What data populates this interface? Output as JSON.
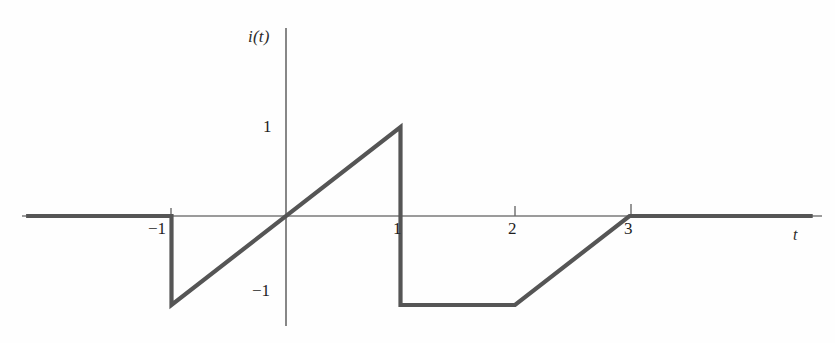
{
  "figure": {
    "kind": "waveform-plot",
    "background": "#fefefe",
    "axis_color": "#6b6b6b",
    "curve_color": "#555555",
    "text_color": "#1f1f1f"
  },
  "axes": {
    "y_axis_label": "i(t)",
    "x_axis_label": "t",
    "x_ticks": [
      {
        "value": -1,
        "label": "−1"
      },
      {
        "value": 1,
        "label": "1"
      },
      {
        "value": 2,
        "label": "2"
      },
      {
        "value": 3,
        "label": "3"
      }
    ],
    "y_ticks": [
      {
        "value": 1,
        "label": "1"
      },
      {
        "value": -1,
        "label": "−1"
      }
    ]
  },
  "chart_data": {
    "type": "line",
    "title": "",
    "xlabel": "t",
    "ylabel": "i(t)",
    "xlim": [
      -2.5,
      4.6
    ],
    "ylim": [
      -1.65,
      1.65
    ],
    "grid": false,
    "legend": null,
    "series": [
      {
        "name": "i(t)",
        "color": "#555555",
        "x": [
          -2.27,
          -1.0,
          -1.0,
          1.0,
          1.0,
          2.0,
          3.0,
          4.6
        ],
        "values": [
          0,
          0,
          -1,
          1,
          -1,
          -1,
          0,
          0
        ]
      }
    ],
    "annotations": [
      "flat zero for t < -1",
      "discontinuous drop to -1 at t = -1",
      "linear ramp from (-1,-1) to (1,1)",
      "discontinuous drop to -1 at t = 1",
      "constant -1 from t = 1 to t = 2",
      "linear ramp from (2,-1) to (3,0)",
      "flat zero for t > 3"
    ]
  }
}
